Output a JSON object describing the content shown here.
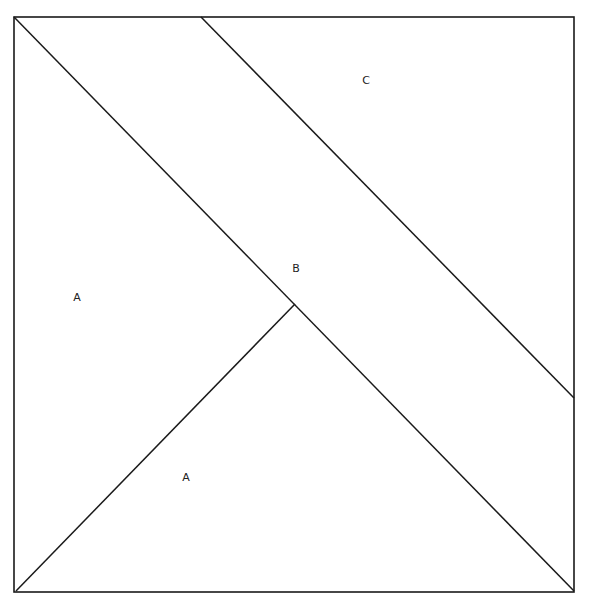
{
  "diagram": {
    "stroke_color": "#1a1a1a",
    "background": "#ffffff",
    "labels": [
      {
        "text": "C",
        "x": 366,
        "y": 80
      },
      {
        "text": "B",
        "x": 296,
        "y": 268
      },
      {
        "text": "A",
        "x": 77,
        "y": 297
      },
      {
        "text": "A",
        "x": 186,
        "y": 477
      }
    ]
  }
}
